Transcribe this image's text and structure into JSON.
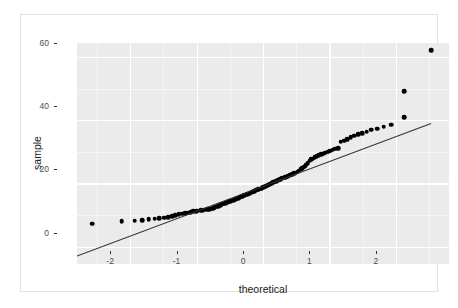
{
  "chart_data": {
    "type": "scatter",
    "title": "",
    "xlabel": "theoretical",
    "ylabel": "sample",
    "xlim": [
      -2.8,
      2.8
    ],
    "ylim": [
      -5.5,
      64.5
    ],
    "xticks": [
      -2,
      -1,
      0,
      1,
      2
    ],
    "xticklabels": [
      "-2",
      "-1",
      "0",
      "1",
      "2"
    ],
    "yticks": [
      0,
      20,
      40,
      60
    ],
    "yticklabels": [
      "0",
      "20",
      "40",
      "60"
    ],
    "grid": true,
    "grid_color": "#ffffff",
    "panel_color": "#ebebeb",
    "point_color": "#000000",
    "line_color": "#333333",
    "legend": "none",
    "series": [
      {
        "name": "sample quantiles",
        "marker": "filled-circle",
        "points": [
          [
            -2.57,
            7.2
          ],
          [
            -2.13,
            8.1
          ],
          [
            -1.93,
            8.2
          ],
          [
            -1.82,
            8.4
          ],
          [
            -1.72,
            8.6
          ],
          [
            -1.63,
            8.8
          ],
          [
            -1.56,
            9.0
          ],
          [
            -1.49,
            9.2
          ],
          [
            -1.43,
            9.4
          ],
          [
            -1.37,
            9.7
          ],
          [
            -1.32,
            9.9
          ],
          [
            -1.27,
            10.2
          ],
          [
            -1.22,
            10.4
          ],
          [
            -1.17,
            10.6
          ],
          [
            -1.13,
            10.8
          ],
          [
            -1.09,
            11.0
          ],
          [
            -1.05,
            11.2
          ],
          [
            -1.01,
            11.3
          ],
          [
            -0.98,
            11.4
          ],
          [
            -0.94,
            11.5
          ],
          [
            -0.91,
            11.6
          ],
          [
            -0.88,
            11.7
          ],
          [
            -0.84,
            11.8
          ],
          [
            -0.81,
            11.9
          ],
          [
            -0.78,
            12.0
          ],
          [
            -0.75,
            12.2
          ],
          [
            -0.73,
            12.4
          ],
          [
            -0.7,
            12.6
          ],
          [
            -0.67,
            12.8
          ],
          [
            -0.64,
            13.1
          ],
          [
            -0.62,
            13.4
          ],
          [
            -0.59,
            13.6
          ],
          [
            -0.57,
            13.8
          ],
          [
            -0.54,
            14.0
          ],
          [
            -0.52,
            14.2
          ],
          [
            -0.49,
            14.4
          ],
          [
            -0.47,
            14.6
          ],
          [
            -0.44,
            14.8
          ],
          [
            -0.42,
            15.0
          ],
          [
            -0.4,
            15.2
          ],
          [
            -0.37,
            15.4
          ],
          [
            -0.35,
            15.6
          ],
          [
            -0.33,
            15.8
          ],
          [
            -0.31,
            16.0
          ],
          [
            -0.28,
            16.2
          ],
          [
            -0.26,
            16.4
          ],
          [
            -0.24,
            16.6
          ],
          [
            -0.22,
            16.8
          ],
          [
            -0.2,
            17.0
          ],
          [
            -0.17,
            17.2
          ],
          [
            -0.15,
            17.4
          ],
          [
            -0.13,
            17.6
          ],
          [
            -0.11,
            17.8
          ],
          [
            -0.09,
            18.0
          ],
          [
            -0.07,
            18.2
          ],
          [
            -0.04,
            18.4
          ],
          [
            -0.02,
            18.6
          ],
          [
            0.0,
            18.8
          ],
          [
            0.02,
            19.0
          ],
          [
            0.04,
            19.2
          ],
          [
            0.07,
            19.4
          ],
          [
            0.09,
            19.6
          ],
          [
            0.11,
            19.9
          ],
          [
            0.13,
            20.1
          ],
          [
            0.15,
            20.4
          ],
          [
            0.17,
            20.6
          ],
          [
            0.2,
            20.8
          ],
          [
            0.22,
            21.0
          ],
          [
            0.24,
            21.2
          ],
          [
            0.26,
            21.4
          ],
          [
            0.28,
            21.6
          ],
          [
            0.31,
            21.8
          ],
          [
            0.33,
            22.0
          ],
          [
            0.35,
            22.2
          ],
          [
            0.37,
            22.4
          ],
          [
            0.4,
            22.6
          ],
          [
            0.42,
            22.8
          ],
          [
            0.44,
            23.0
          ],
          [
            0.47,
            23.2
          ],
          [
            0.49,
            23.4
          ],
          [
            0.52,
            23.7
          ],
          [
            0.54,
            24.1
          ],
          [
            0.57,
            24.5
          ],
          [
            0.59,
            24.9
          ],
          [
            0.62,
            25.3
          ],
          [
            0.64,
            25.8
          ],
          [
            0.67,
            26.4
          ],
          [
            0.7,
            27.2
          ],
          [
            0.73,
            27.6
          ],
          [
            0.75,
            27.9
          ],
          [
            0.78,
            28.3
          ],
          [
            0.81,
            28.6
          ],
          [
            0.84,
            28.9
          ],
          [
            0.88,
            29.2
          ],
          [
            0.91,
            29.5
          ],
          [
            0.94,
            29.8
          ],
          [
            0.98,
            30.1
          ],
          [
            1.01,
            30.4
          ],
          [
            1.05,
            30.7
          ],
          [
            1.09,
            31.0
          ],
          [
            1.13,
            31.2
          ],
          [
            1.17,
            33.2
          ],
          [
            1.22,
            33.6
          ],
          [
            1.27,
            34.0
          ],
          [
            1.32,
            34.6
          ],
          [
            1.37,
            35.2
          ],
          [
            1.43,
            35.6
          ],
          [
            1.49,
            36.0
          ],
          [
            1.56,
            36.4
          ],
          [
            1.63,
            37.0
          ],
          [
            1.72,
            37.4
          ],
          [
            1.82,
            38.0
          ],
          [
            1.93,
            38.6
          ],
          [
            2.13,
            41.0
          ],
          [
            2.13,
            49.2
          ],
          [
            2.53,
            62.2
          ]
        ]
      }
    ],
    "reference_line": {
      "name": "qq-reference-line",
      "x0": -2.8,
      "y0": -3.0,
      "x1": 2.53,
      "y1": 39.0
    }
  }
}
